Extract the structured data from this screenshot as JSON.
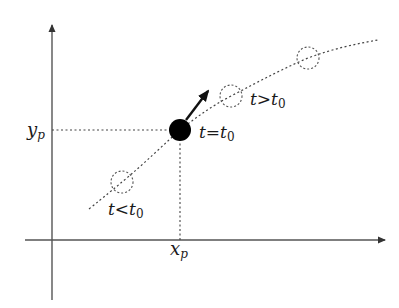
{
  "diagram": {
    "type": "trajectory-sketch",
    "colors": {
      "axis": "#555555",
      "curve": "#444444",
      "particle": "#000000",
      "ghost_circle": "#555555",
      "text": "#1a1a1a"
    },
    "axes": {
      "x_axis": {
        "from": [
          25,
          240
        ],
        "to": [
          385,
          240
        ],
        "arrow": true
      },
      "y_axis": {
        "from": [
          52,
          300
        ],
        "to": [
          52,
          25
        ],
        "arrow": true
      }
    },
    "curve": {
      "style": "dotted",
      "points": [
        [
          89,
          209
        ],
        [
          122,
          182
        ],
        [
          180,
          130
        ],
        [
          231,
          96
        ],
        [
          308,
          58
        ],
        [
          378,
          40
        ]
      ]
    },
    "particle": {
      "center": [
        180,
        130
      ],
      "radius": 11,
      "fill": "#000000"
    },
    "velocity_arrow": {
      "from": [
        187,
        119
      ],
      "to": [
        208,
        91
      ]
    },
    "ghost_positions": [
      {
        "center": [
          122,
          182
        ],
        "radius": 11,
        "style": "dashed",
        "label": "t<t0"
      },
      {
        "center": [
          231,
          96
        ],
        "radius": 11,
        "style": "dashed",
        "label": "t>t0"
      },
      {
        "center": [
          308,
          58
        ],
        "radius": 11,
        "style": "dashed",
        "label": ""
      }
    ],
    "guides": {
      "horizontal": {
        "from": [
          52,
          130
        ],
        "to": [
          180,
          130
        ],
        "style": "dotted"
      },
      "vertical": {
        "from": [
          180,
          130
        ],
        "to": [
          180,
          240
        ],
        "style": "dotted"
      }
    },
    "labels": {
      "yp": {
        "main": "y",
        "sub": "p"
      },
      "xp": {
        "main": "x",
        "sub": "p"
      },
      "t_eq": {
        "t": "t",
        "op": "=",
        "t0": "t",
        "sub": "0"
      },
      "t_gt": {
        "t": "t",
        "op": ">",
        "t0": "t",
        "sub": "0"
      },
      "t_lt": {
        "t": "t",
        "op": "<",
        "t0": "t",
        "sub": "0"
      }
    }
  }
}
